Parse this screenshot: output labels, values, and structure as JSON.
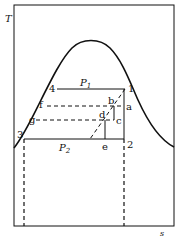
{
  "diagram": {
    "axes": {
      "y_label": "T",
      "x_label": "s"
    },
    "pressures": {
      "high": {
        "symbol": "P",
        "subscript": "1"
      },
      "low": {
        "symbol": "P",
        "subscript": "2"
      }
    },
    "points": {
      "p1": "1",
      "p2": "2",
      "p3": "3",
      "p4": "4",
      "a": "a",
      "b": "b",
      "c": "c",
      "d": "d",
      "e": "e",
      "f": "f",
      "g": "g"
    },
    "colors": {
      "line": "#111111",
      "background": "#ffffff"
    }
  }
}
